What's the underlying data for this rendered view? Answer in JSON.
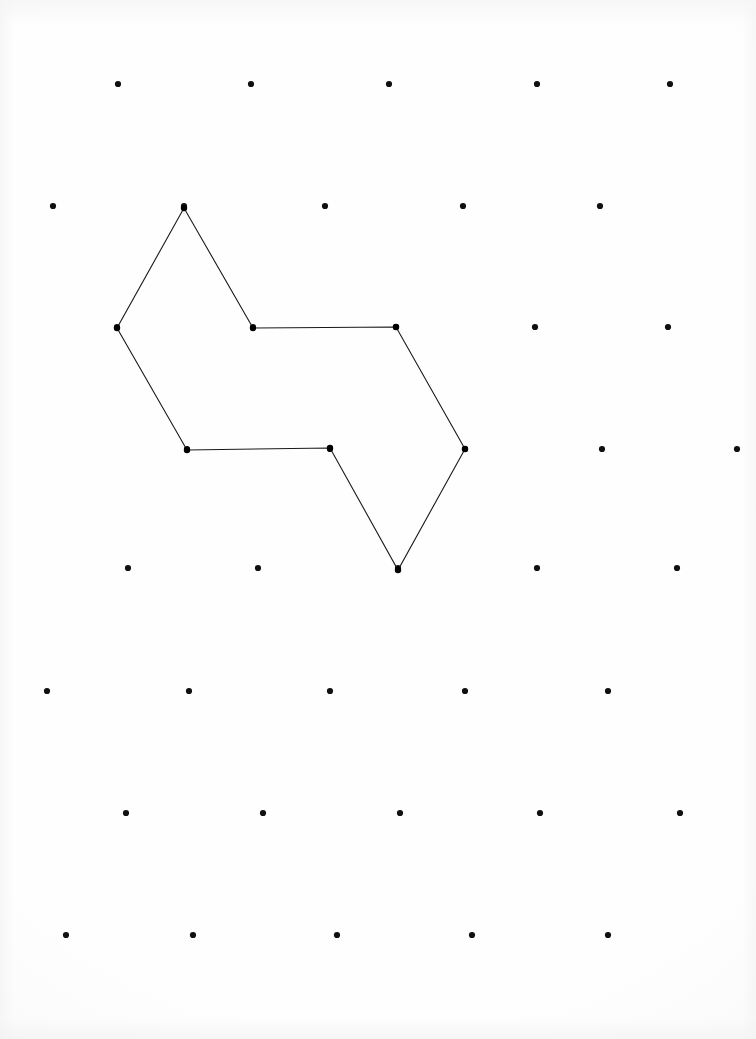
{
  "figure": {
    "background_color": "#fefefe",
    "dot_color": "#101010",
    "line_color": "#1a1a1a",
    "canvas_width": 756,
    "canvas_height": 1039,
    "dot_radius": 3.1,
    "vertex_radius": 3.2,
    "line_width": 1.1
  },
  "chart_data": {
    "type": "scatter",
    "xlabel": "",
    "ylabel": "",
    "xlim": [
      0,
      756
    ],
    "ylim": [
      0,
      1039
    ],
    "grid": false,
    "legend": "none",
    "lattice_description": "Staggered triangular dot lattice, 8 rows alternating 5 dots per row",
    "grid_rows": [
      {
        "row": 1,
        "y": 84,
        "x": [
          118,
          251,
          389,
          537,
          670
        ]
      },
      {
        "row": 2,
        "y": 206,
        "x": [
          53,
          184,
          325,
          463,
          600
        ]
      },
      {
        "row": 3,
        "y": 327,
        "x": [
          117,
          253,
          396,
          535,
          668
        ]
      },
      {
        "row": 4,
        "y": 449,
        "x": [
          187,
          330,
          465,
          602,
          737
        ]
      },
      {
        "row": 5,
        "y": 568,
        "x": [
          128,
          258,
          398,
          537,
          677
        ]
      },
      {
        "row": 6,
        "y": 691,
        "x": [
          47,
          189,
          330,
          465,
          608
        ]
      },
      {
        "row": 7,
        "y": 813,
        "x": [
          126,
          263,
          400,
          540,
          680
        ]
      },
      {
        "row": 8,
        "y": 935,
        "x": [
          66,
          193,
          337,
          472,
          608
        ]
      }
    ],
    "polygon": {
      "closed": true,
      "vertex_count": 8,
      "vertices": [
        {
          "label": "apex-top",
          "x": 184,
          "y": 208
        },
        {
          "label": "left-upper",
          "x": 117,
          "y": 328
        },
        {
          "label": "left-lower",
          "x": 187,
          "y": 450
        },
        {
          "label": "notch-bottom-left",
          "x": 330,
          "y": 448
        },
        {
          "label": "bottom-point",
          "x": 398,
          "y": 570
        },
        {
          "label": "right-point",
          "x": 465,
          "y": 449
        },
        {
          "label": "right-upper",
          "x": 396,
          "y": 327
        },
        {
          "label": "notch-top-left",
          "x": 253,
          "y": 328
        }
      ],
      "edges": [
        "apex-top → left-upper",
        "left-upper → left-lower",
        "left-lower → notch-bottom-left",
        "notch-bottom-left → bottom-point",
        "bottom-point → right-point",
        "right-point → right-upper",
        "right-upper → notch-top-left",
        "notch-top-left → apex-top"
      ]
    }
  }
}
